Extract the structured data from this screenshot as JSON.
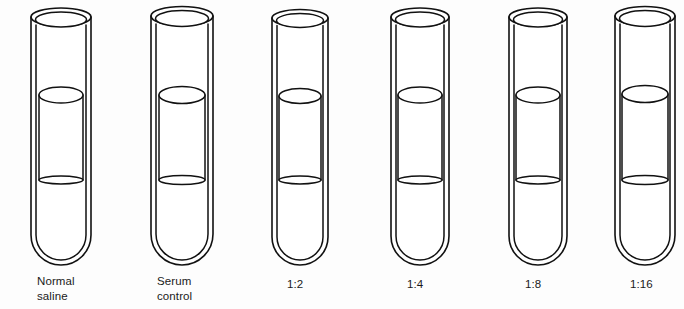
{
  "figure": {
    "background_color": "#fdfdfd",
    "line_color": "#111111",
    "width": 684,
    "height": 309
  },
  "tubes": [
    {
      "id": "tube-normal-saline",
      "label": "Normal\nsaline",
      "label_x": 37,
      "label_y": 274,
      "center_x": 61,
      "half_width": 30,
      "rim_top_y": 17,
      "rim_ry": 9,
      "lip_gap": 6,
      "meniscus_y": 95,
      "meniscus_ry": 8,
      "level_y": 180,
      "level_ry": 4,
      "bottom_y": 265,
      "inner_inset": 5,
      "column_half_width": 22
    },
    {
      "id": "tube-serum-control",
      "label": "Serum\ncontrol",
      "label_x": 157,
      "label_y": 274,
      "center_x": 182,
      "half_width": 31,
      "rim_top_y": 16,
      "rim_ry": 9.5,
      "lip_gap": 6,
      "meniscus_y": 95,
      "meniscus_ry": 8.5,
      "level_y": 180,
      "level_ry": 4.5,
      "bottom_y": 265,
      "inner_inset": 5,
      "column_half_width": 23
    },
    {
      "id": "tube-1-2",
      "label": "1:2",
      "label_x": 287,
      "label_y": 277,
      "center_x": 300,
      "half_width": 28,
      "rim_top_y": 18,
      "rim_ry": 8.5,
      "lip_gap": 5.5,
      "meniscus_y": 96,
      "meniscus_ry": 7.5,
      "level_y": 180,
      "level_ry": 4,
      "bottom_y": 265,
      "inner_inset": 5,
      "column_half_width": 21
    },
    {
      "id": "tube-1-4",
      "label": "1:4",
      "label_x": 407,
      "label_y": 277,
      "center_x": 420,
      "half_width": 29,
      "rim_top_y": 17,
      "rim_ry": 9,
      "lip_gap": 6,
      "meniscus_y": 95,
      "meniscus_ry": 8,
      "level_y": 180,
      "level_ry": 4,
      "bottom_y": 265,
      "inner_inset": 5,
      "column_half_width": 22
    },
    {
      "id": "tube-1-8",
      "label": "1:8",
      "label_x": 525,
      "label_y": 277,
      "center_x": 538,
      "half_width": 29,
      "rim_top_y": 17,
      "rim_ry": 9,
      "lip_gap": 6,
      "meniscus_y": 95,
      "meniscus_ry": 8,
      "level_y": 180,
      "level_ry": 4,
      "bottom_y": 265,
      "inner_inset": 5,
      "column_half_width": 22
    },
    {
      "id": "tube-1-16",
      "label": "1:16",
      "label_x": 630,
      "label_y": 277,
      "center_x": 645,
      "half_width": 30,
      "rim_top_y": 16,
      "rim_ry": 9.5,
      "lip_gap": 6,
      "meniscus_y": 94,
      "meniscus_ry": 8.5,
      "level_y": 180,
      "level_ry": 4.5,
      "bottom_y": 265,
      "inner_inset": 5,
      "column_half_width": 23
    }
  ]
}
